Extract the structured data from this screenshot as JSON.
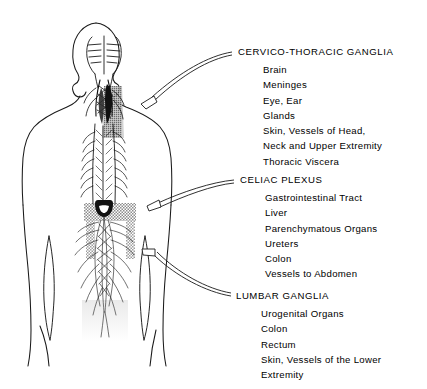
{
  "figure": {
    "ink_color": "#000000",
    "background_color": "#ffffff",
    "shade_color": "#9a9a9a",
    "regions": [
      {
        "name": "cervico-thoracic-ganglia-region",
        "shading": "dark"
      },
      {
        "name": "celiac-plexus-region",
        "shading": "halftone-gray"
      },
      {
        "name": "lumbar-ganglia-region",
        "shading": "light"
      }
    ]
  },
  "blocks": [
    {
      "id": "cervico",
      "heading": "CERVICO-THORACIC GANGLIA",
      "items": [
        "Brain",
        "Meninges",
        "Eye, Ear",
        "Glands",
        "Skin, Vessels of Head,",
        "Neck and Upper Extremity",
        "Thoracic Viscera"
      ]
    },
    {
      "id": "celiac",
      "heading": "CELIAC PLEXUS",
      "items": [
        "Gastrointestinal Tract",
        "Liver",
        "Parenchymatous Organs",
        "Ureters",
        "Colon",
        "Vessels to Abdomen"
      ]
    },
    {
      "id": "lumbar",
      "heading": "LUMBAR GANGLIA",
      "items": [
        "Urogenital Organs",
        "Colon",
        "Rectum",
        "Skin, Vessels of the Lower",
        "Extremity"
      ]
    }
  ]
}
